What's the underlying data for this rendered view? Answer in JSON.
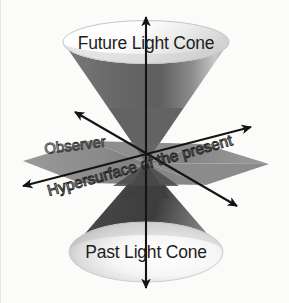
{
  "figure": {
    "name": "light-cone-spacetime-diagram",
    "background_color": "#fbfbfa",
    "width": 289,
    "height": 303
  },
  "labels": {
    "future_cone": "Future Light Cone",
    "past_cone": "Past Light Cone",
    "observer": "Observer",
    "hypersurface": "Hypersurface of the present"
  },
  "colors": {
    "cone_upper_fill": "#6e6e6e",
    "cone_upper_highlight": "#b9b9b9",
    "cone_lower_fill": "#4a4a4a",
    "plane_fill": "#8a8a8a",
    "plane_fill_dark": "#6f6f6f",
    "cap_stroke": "#c9c9c9",
    "axis_color": "#141414",
    "text_color": "#1d1d1d"
  },
  "elements": {
    "vertical_axis": "time-axis",
    "diagonal_axis_a": "space-axis-a",
    "diagonal_axis_b": "space-axis-b",
    "top_cap": "future-cone-top-ellipse",
    "bottom_cap": "past-cone-bottom-ellipse",
    "plane": "hypersurface-plane",
    "apex": "observer-apex-point"
  }
}
